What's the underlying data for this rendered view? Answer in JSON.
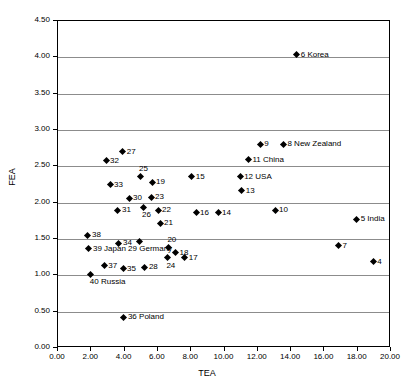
{
  "chart_data": {
    "type": "scatter",
    "title": "",
    "xlabel": "TEA",
    "ylabel": "FEA",
    "xlim": [
      0.0,
      20.0
    ],
    "ylim": [
      0.0,
      4.5
    ],
    "xticks": [
      "0.00",
      "2.00",
      "4.00",
      "6.00",
      "8.00",
      "10.00",
      "12.00",
      "14.00",
      "16.00",
      "18.00",
      "20.00"
    ],
    "yticks": [
      "0.00",
      "0.50",
      "1.00",
      "1.50",
      "2.00",
      "2.50",
      "3.00",
      "3.50",
      "4.00",
      "4.50"
    ],
    "grid": "horizontal",
    "legend": "none",
    "marker": "diamond",
    "marker_color": "#000000",
    "points": [
      {
        "label": "6 Korea",
        "x": 14.4,
        "y": 4.02,
        "pos": "right"
      },
      {
        "label": "9",
        "x": 12.2,
        "y": 2.79,
        "pos": "right"
      },
      {
        "label": "8 New Zealand",
        "x": 13.6,
        "y": 2.79,
        "pos": "right"
      },
      {
        "label": "27",
        "x": 3.95,
        "y": 2.69,
        "pos": "right"
      },
      {
        "label": "11 China",
        "x": 11.5,
        "y": 2.58,
        "pos": "right"
      },
      {
        "label": "32",
        "x": 2.95,
        "y": 2.56,
        "pos": "right"
      },
      {
        "label": "25",
        "x": 4.99,
        "y": 2.35,
        "pos": "above"
      },
      {
        "label": "15",
        "x": 8.1,
        "y": 2.34,
        "pos": "right"
      },
      {
        "label": "12 USA",
        "x": 11.0,
        "y": 2.34,
        "pos": "right"
      },
      {
        "label": "19",
        "x": 5.71,
        "y": 2.27,
        "pos": "right"
      },
      {
        "label": "33",
        "x": 3.19,
        "y": 2.23,
        "pos": "right"
      },
      {
        "label": "13",
        "x": 11.1,
        "y": 2.15,
        "pos": "right"
      },
      {
        "label": "30",
        "x": 4.33,
        "y": 2.05,
        "pos": "right"
      },
      {
        "label": "23",
        "x": 5.65,
        "y": 2.06,
        "pos": "right"
      },
      {
        "label": "26",
        "x": 5.17,
        "y": 1.92,
        "pos": "below"
      },
      {
        "label": "22",
        "x": 6.07,
        "y": 1.88,
        "pos": "right"
      },
      {
        "label": "31",
        "x": 3.66,
        "y": 1.88,
        "pos": "right"
      },
      {
        "label": "16",
        "x": 8.35,
        "y": 1.85,
        "pos": "right"
      },
      {
        "label": "14",
        "x": 9.67,
        "y": 1.85,
        "pos": "right"
      },
      {
        "label": "10",
        "x": 13.1,
        "y": 1.88,
        "pos": "right"
      },
      {
        "label": "5 India",
        "x": 18.0,
        "y": 1.76,
        "pos": "right"
      },
      {
        "label": "21",
        "x": 6.19,
        "y": 1.7,
        "pos": "right"
      },
      {
        "label": "38",
        "x": 1.86,
        "y": 1.54,
        "pos": "right"
      },
      {
        "label": "34",
        "x": 3.72,
        "y": 1.43,
        "pos": "right"
      },
      {
        "label": "29",
        "x": 4.93,
        "y": 1.45,
        "pos": "nolabel"
      },
      {
        "label": "7",
        "x": 16.9,
        "y": 1.39,
        "pos": "right"
      },
      {
        "label": "20",
        "x": 6.69,
        "y": 1.37,
        "pos": "above"
      },
      {
        "label": "39 Japan 29 Germany",
        "x": 1.92,
        "y": 1.35,
        "pos": "right"
      },
      {
        "label": "18",
        "x": 7.12,
        "y": 1.3,
        "pos": "right"
      },
      {
        "label": "24",
        "x": 6.63,
        "y": 1.23,
        "pos": "below"
      },
      {
        "label": "17",
        "x": 7.67,
        "y": 1.23,
        "pos": "right"
      },
      {
        "label": "4",
        "x": 19.0,
        "y": 1.17,
        "pos": "right"
      },
      {
        "label": "37",
        "x": 2.84,
        "y": 1.12,
        "pos": "right"
      },
      {
        "label": "28",
        "x": 5.28,
        "y": 1.1,
        "pos": "right"
      },
      {
        "label": "35",
        "x": 3.97,
        "y": 1.08,
        "pos": "right"
      },
      {
        "label": "40 Russia",
        "x": 2.03,
        "y": 1.0,
        "pos": "below"
      },
      {
        "label": "36 Poland",
        "x": 4.02,
        "y": 0.41,
        "pos": "right"
      }
    ]
  }
}
